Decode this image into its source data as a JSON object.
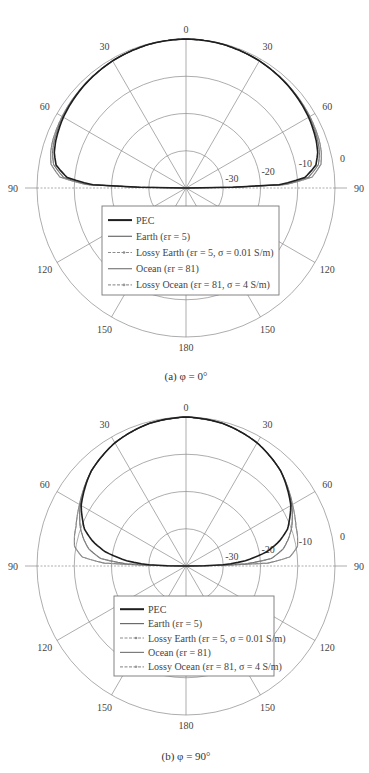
{
  "chart_data": [
    {
      "type": "polar",
      "title": "",
      "caption": "(a) φ = 0°",
      "angle_ticks": [
        "0",
        "30",
        "60",
        "90",
        "120",
        "150",
        "180",
        "150",
        "120",
        "90",
        "60",
        "30"
      ],
      "angle_tick_values_deg": [
        0,
        30,
        60,
        90,
        120,
        150,
        180,
        210,
        240,
        270,
        300,
        330
      ],
      "radial_ticks": [
        "-30",
        "-20",
        "-10",
        "0"
      ],
      "radial_range_db": [
        -40,
        0
      ],
      "grid": true,
      "legend_position": "lower-center",
      "series": [
        {
          "name": "PEC",
          "style": "solid-thick",
          "color": "#1a1a1a"
        },
        {
          "name": "Earth (εr = 5)",
          "style": "solid",
          "color": "#6a6a6a"
        },
        {
          "name": "Lossy Earth (εr = 5, σ = 0.01 S/m)",
          "style": "dash-marker",
          "color": "#8a8a8a"
        },
        {
          "name": "Ocean (εr = 81)",
          "style": "solid",
          "color": "#7a7a7a"
        },
        {
          "name": "Lossy Ocean (εr = 81, σ = 4 S/m)",
          "style": "dash-marker",
          "color": "#999999"
        }
      ],
      "pattern_points_db": {
        "theta_deg": [
          0,
          15,
          30,
          45,
          60,
          70,
          75,
          80,
          85,
          88,
          90
        ],
        "PEC": [
          0,
          -0.2,
          -0.6,
          -1.2,
          -2.0,
          -2.8,
          -3.4,
          -4.6,
          -8,
          -15,
          -40
        ],
        "Earth": [
          0,
          -0.2,
          -0.6,
          -1.2,
          -1.8,
          -2.4,
          -2.9,
          -3.9,
          -7,
          -14,
          -40
        ],
        "Lossy Earth": [
          0,
          -0.2,
          -0.6,
          -1.2,
          -1.8,
          -2.4,
          -2.9,
          -3.9,
          -7,
          -14,
          -40
        ],
        "Ocean": [
          0,
          -0.2,
          -0.6,
          -1.1,
          -1.6,
          -2.0,
          -2.4,
          -3.2,
          -6,
          -13,
          -40
        ],
        "Lossy Ocean": [
          0,
          -0.2,
          -0.6,
          -1.1,
          -1.6,
          -2.0,
          -2.4,
          -3.2,
          -6,
          -13,
          -40
        ]
      }
    },
    {
      "type": "polar",
      "title": "",
      "caption": "(b) φ = 90°",
      "angle_ticks": [
        "0",
        "30",
        "60",
        "90",
        "120",
        "150",
        "180",
        "150",
        "120",
        "90",
        "60",
        "30"
      ],
      "angle_tick_values_deg": [
        0,
        30,
        60,
        90,
        120,
        150,
        180,
        210,
        240,
        270,
        300,
        330
      ],
      "radial_ticks": [
        "-30",
        "-20",
        "-10",
        "0"
      ],
      "radial_range_db": [
        -40,
        0
      ],
      "grid": true,
      "legend_position": "lower-center",
      "series": [
        {
          "name": "PEC",
          "style": "solid-thick",
          "color": "#1a1a1a"
        },
        {
          "name": "Earth (εr = 5)",
          "style": "solid",
          "color": "#6a6a6a"
        },
        {
          "name": "Lossy Earth (εr = 5, σ = 0.01 S/m)",
          "style": "dash-marker",
          "color": "#8a8a8a"
        },
        {
          "name": "Ocean (εr = 81)",
          "style": "solid",
          "color": "#7a7a7a"
        },
        {
          "name": "Lossy Ocean (εr = 81, σ = 4 S/m)",
          "style": "dash-marker",
          "color": "#999999"
        }
      ],
      "pattern_points_db": {
        "theta_deg": [
          0,
          15,
          30,
          45,
          60,
          70,
          75,
          80,
          85,
          88,
          90
        ],
        "PEC": [
          0,
          -0.5,
          -1.8,
          -4.0,
          -7.5,
          -11,
          -14,
          -18,
          -24,
          -30,
          -40
        ],
        "Earth": [
          0,
          -0.5,
          -1.8,
          -4.0,
          -7.2,
          -9.8,
          -11.5,
          -13.5,
          -17,
          -24,
          -40
        ],
        "Lossy Earth": [
          0,
          -0.5,
          -1.8,
          -4.0,
          -7.2,
          -9.8,
          -11.5,
          -13.5,
          -17,
          -24,
          -40
        ],
        "Ocean": [
          0,
          -0.5,
          -1.8,
          -4.0,
          -7.0,
          -8.6,
          -9.0,
          -9.6,
          -12,
          -18,
          -40
        ],
        "Lossy Ocean": [
          0,
          -0.5,
          -1.8,
          -4.0,
          -7.0,
          -8.6,
          -9.0,
          -9.6,
          -12,
          -18,
          -40
        ]
      }
    }
  ],
  "legend": {
    "items": [
      {
        "label": "PEC"
      },
      {
        "label": "Earth (εr = 5)"
      },
      {
        "label": "Lossy Earth (εr = 5,  σ = 0.01 S/m)"
      },
      {
        "label": "Ocean (εr = 81)"
      },
      {
        "label": "Lossy Ocean (εr = 81,  σ = 4 S/m)"
      }
    ]
  },
  "captions": {
    "a": "(a)  φ = 0°",
    "b": "(b)  φ = 90°"
  }
}
